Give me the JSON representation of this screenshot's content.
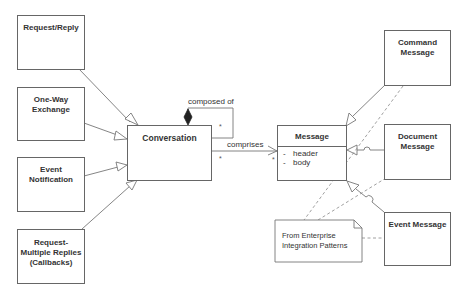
{
  "diagram": {
    "type": "UML class diagram",
    "caption": "From Enterprise Integration Patterns",
    "colors": {
      "line": "#666666",
      "text": "#333333",
      "background": "#ffffff"
    },
    "classes": {
      "request_reply": {
        "label": "Request/Reply"
      },
      "one_way": {
        "label_line1": "One-Way",
        "label_line2": "Exchange"
      },
      "event_notification": {
        "label_line1": "Event",
        "label_line2": "Notification"
      },
      "request_multiple": {
        "label_line1": "Request-",
        "label_line2": "Multiple Replies",
        "label_line3": "(Callbacks)"
      },
      "conversation": {
        "label": "Conversation"
      },
      "message": {
        "label": "Message",
        "attributes": [
          {
            "marker": "-",
            "name": "header"
          },
          {
            "marker": "-",
            "name": "body"
          }
        ]
      },
      "command_message": {
        "label_line1": "Command",
        "label_line2": "Message"
      },
      "document_message": {
        "label_line1": "Document",
        "label_line2": "Message"
      },
      "event_message": {
        "label": "Event Message"
      }
    },
    "relationships": {
      "composition": {
        "label": "composed of",
        "multiplicity": "*"
      },
      "association": {
        "label": "comprises",
        "source_multiplicity": "*",
        "target_multiplicity": "*"
      }
    },
    "note": {
      "line1": "From Enterprise",
      "line2": "Integration Patterns"
    }
  }
}
